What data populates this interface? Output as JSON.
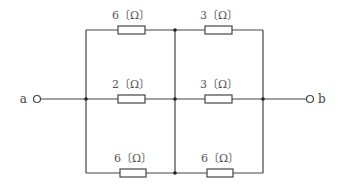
{
  "diagram": {
    "type": "circuit",
    "terminals": [
      {
        "id": "a",
        "label": "a"
      },
      {
        "id": "b",
        "label": "b"
      }
    ],
    "resistors": [
      {
        "id": "R1",
        "position": "top-left",
        "value": "6",
        "unit": "〔Ω〕",
        "label": "6〔Ω〕"
      },
      {
        "id": "R2",
        "position": "top-right",
        "value": "3",
        "unit": "〔Ω〕",
        "label": "3〔Ω〕"
      },
      {
        "id": "R3",
        "position": "middle-left",
        "value": "2",
        "unit": "〔Ω〕",
        "label": "2〔Ω〕"
      },
      {
        "id": "R4",
        "position": "middle-right",
        "value": "3",
        "unit": "〔Ω〕",
        "label": "3〔Ω〕"
      },
      {
        "id": "R5",
        "position": "bottom-left",
        "value": "6",
        "unit": "〔Ω〕",
        "label": "6〔Ω〕"
      },
      {
        "id": "R6",
        "position": "bottom-right",
        "value": "6",
        "unit": "〔Ω〕",
        "label": "6〔Ω〕"
      }
    ]
  }
}
